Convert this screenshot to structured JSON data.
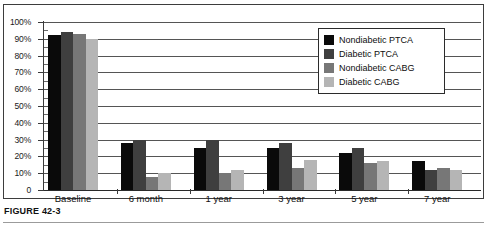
{
  "figure": {
    "caption": "FIGURE 42-3"
  },
  "chart_data": {
    "type": "bar",
    "title": "",
    "xlabel": "",
    "ylabel": "",
    "ylim": [
      0,
      100
    ],
    "ytick_labels": [
      "100%",
      "90%",
      "80%",
      "70%",
      "60%",
      "50%",
      "40%",
      "30%",
      "20%",
      "10%",
      "0"
    ],
    "ytick_values": [
      100,
      90,
      80,
      70,
      60,
      50,
      40,
      30,
      20,
      10,
      0
    ],
    "grid": true,
    "legend_position": "upper-right",
    "categories": [
      "Baseline",
      "6 month",
      "1 year",
      "3 year",
      "5 year",
      "7 year"
    ],
    "series": [
      {
        "name": "Nondiabetic PTCA",
        "color": "#0a0a0a",
        "values": [
          92,
          28,
          25,
          25,
          22,
          17
        ]
      },
      {
        "name": "Diabetic PTCA",
        "color": "#3f3f3f",
        "values": [
          94,
          30,
          30,
          28,
          25,
          12
        ]
      },
      {
        "name": "Nondiabetic CABG",
        "color": "#777777",
        "values": [
          93,
          8,
          10,
          13,
          16,
          13
        ]
      },
      {
        "name": "Diabetic CABG",
        "color": "#b5b5b5",
        "values": [
          90,
          10,
          12,
          18,
          17,
          12
        ]
      }
    ]
  }
}
